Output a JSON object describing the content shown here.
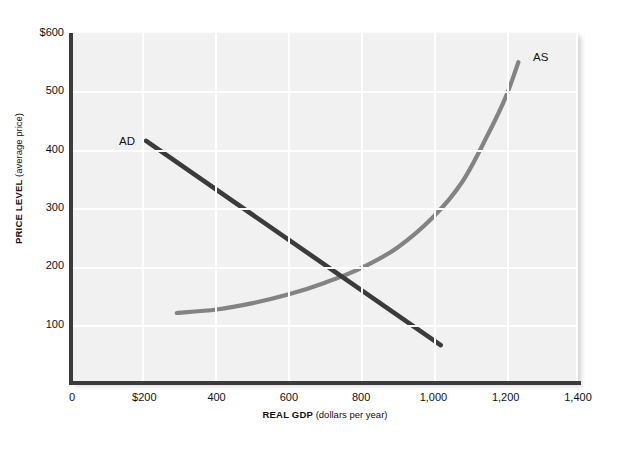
{
  "chart_data": {
    "type": "line",
    "title": "",
    "xlabel_strong": "REAL GDP",
    "xlabel_note": "(dollars per year)",
    "ylabel_strong": "PRICE LEVEL",
    "ylabel_note": "(average price)",
    "xlim": [
      0,
      1400
    ],
    "ylim": [
      0,
      600
    ],
    "grid": true,
    "legend": "inline-curve-labels",
    "xticks": [
      {
        "value": 0,
        "label": "0"
      },
      {
        "value": 200,
        "label": "$200"
      },
      {
        "value": 400,
        "label": "400"
      },
      {
        "value": 600,
        "label": "600"
      },
      {
        "value": 800,
        "label": "800"
      },
      {
        "value": 1000,
        "label": "1,000"
      },
      {
        "value": 1200,
        "label": "1,200"
      },
      {
        "value": 1400,
        "label": "1,400"
      }
    ],
    "yticks": [
      {
        "value": 100,
        "label": "100"
      },
      {
        "value": 200,
        "label": "200"
      },
      {
        "value": 300,
        "label": "300"
      },
      {
        "value": 400,
        "label": "400"
      },
      {
        "value": 500,
        "label": "500"
      },
      {
        "value": 600,
        "label": "$600"
      }
    ],
    "series": [
      {
        "name": "AD",
        "label": "AD",
        "color": "#3b3b3b",
        "kind": "straight-line",
        "points": [
          {
            "x": 205,
            "y": 415
          },
          {
            "x": 1020,
            "y": 65
          }
        ]
      },
      {
        "name": "AS",
        "label": "AS",
        "color": "#838383",
        "kind": "curve",
        "points": [
          {
            "x": 290,
            "y": 120
          },
          {
            "x": 400,
            "y": 126
          },
          {
            "x": 500,
            "y": 137
          },
          {
            "x": 600,
            "y": 152
          },
          {
            "x": 700,
            "y": 172
          },
          {
            "x": 800,
            "y": 197
          },
          {
            "x": 900,
            "y": 232
          },
          {
            "x": 1000,
            "y": 285
          },
          {
            "x": 1080,
            "y": 345
          },
          {
            "x": 1150,
            "y": 425
          },
          {
            "x": 1200,
            "y": 490
          },
          {
            "x": 1235,
            "y": 550
          }
        ]
      }
    ],
    "equilibrium": {
      "x": 800,
      "y": 160
    }
  }
}
